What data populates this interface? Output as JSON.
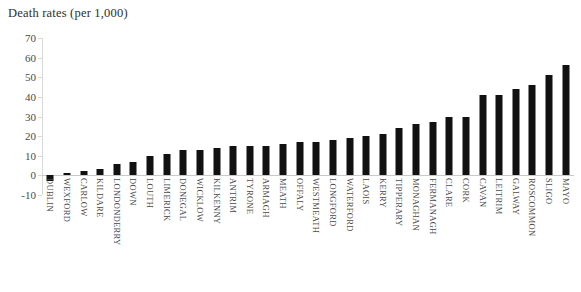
{
  "chart_data": {
    "type": "bar",
    "title": "Death rates (per 1,000)",
    "xlabel": "",
    "ylabel": "",
    "ylim": [
      -10,
      70
    ],
    "yticks": [
      70,
      60,
      50,
      40,
      30,
      20,
      10,
      0,
      -10
    ],
    "grid": false,
    "legend": false,
    "bar_color": "#111111",
    "categories": [
      "DUBLIN",
      "WEXFORD",
      "CARLOW",
      "KILDARE",
      "LONDONDERRY",
      "DOWN",
      "LOUTH",
      "LIMERICK",
      "DONEGAL",
      "WICKLOW",
      "KILKENNY",
      "ANTRIM",
      "TYRONE",
      "ARMAGH",
      "MEATH",
      "OFFALY",
      "WESTMEATH",
      "LONGFORD",
      "WATERFORD",
      "LAOIS",
      "KERRY",
      "TIPPERARY",
      "MONAGHAN",
      "FERMANAGH",
      "CLARE",
      "CORK",
      "CAVAN",
      "LEITRIM",
      "GALWAY",
      "ROSCOMMON",
      "SLIGO",
      "MAYO"
    ],
    "values": [
      -3,
      1,
      2,
      3,
      6,
      7,
      10,
      11,
      13,
      13,
      14,
      15,
      15,
      15,
      16,
      17,
      17,
      18,
      19,
      20,
      21,
      24,
      26,
      27,
      30,
      30,
      41,
      41,
      44,
      46,
      51,
      56
    ]
  }
}
